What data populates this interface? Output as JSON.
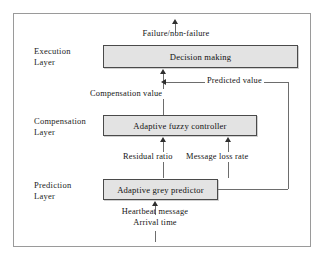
{
  "diagram": {
    "frame": {
      "border_color": "#9a9a9a",
      "background": "#ffffff"
    },
    "box_style": {
      "fill": "#e3e3e3",
      "border": "#4a4a4a"
    },
    "layers": [
      {
        "id": "execution",
        "label_line1": "Execution",
        "label_line2": "Layer"
      },
      {
        "id": "compensation",
        "label_line1": "Compensation",
        "label_line2": "Layer"
      },
      {
        "id": "prediction",
        "label_line1": "Prediction",
        "label_line2": "Layer"
      }
    ],
    "nodes": [
      {
        "id": "decision-making",
        "label": "Decision making"
      },
      {
        "id": "adaptive-fuzzy-controller",
        "label": "Adaptive fuzzy controller"
      },
      {
        "id": "adaptive-grey-predictor",
        "label": "Adaptive grey predictor"
      }
    ],
    "edge_labels": [
      {
        "id": "output",
        "text": "Failure/non-failure"
      },
      {
        "id": "compensation-value",
        "text": "Compensation value"
      },
      {
        "id": "predicted-value",
        "text": "Predicted value"
      },
      {
        "id": "residual-ratio",
        "text": "Residual ratio"
      },
      {
        "id": "message-loss-rate",
        "text": "Message loss rate"
      },
      {
        "id": "input-line1",
        "text": "Heartbeat message"
      },
      {
        "id": "input-line2",
        "text": "Arrival time"
      }
    ]
  }
}
